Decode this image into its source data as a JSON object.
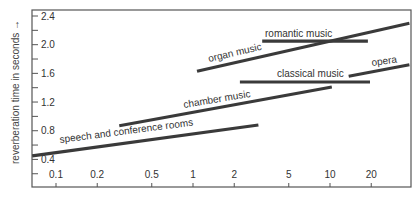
{
  "chart_data": {
    "type": "line",
    "title": "",
    "xlabel": "",
    "ylabel": "reverberation time in seconds →",
    "xscale": "log",
    "x_ticks": [
      0.1,
      0.2,
      0.5,
      1,
      2,
      5,
      10,
      20
    ],
    "x_tick_labels": [
      "0.1",
      "0.2",
      "0.5",
      "1",
      "2",
      "5",
      "10",
      "20"
    ],
    "y_ticks": [
      0.4,
      0.8,
      1.2,
      1.6,
      2.0,
      2.4
    ],
    "y_tick_labels": [
      "0.4",
      "0.8",
      "1.2",
      "1.6",
      "2.0",
      "2.4"
    ],
    "y_minor_ticks": [
      0.2,
      0.6,
      1.0,
      1.4,
      1.8,
      2.2
    ],
    "xlim": [
      0.067,
      38
    ],
    "ylim": [
      0.0,
      2.5
    ],
    "grid": false,
    "legend": "inline labels",
    "series": [
      {
        "name": "speech and conference rooms",
        "x": [
          0.067,
          3.0
        ],
        "y": [
          0.45,
          0.88
        ]
      },
      {
        "name": "chamber music",
        "x": [
          0.29,
          10.3
        ],
        "y": [
          0.87,
          1.41
        ]
      },
      {
        "name": "organ music",
        "x": [
          1.07,
          38
        ],
        "y": [
          1.63,
          2.3
        ]
      },
      {
        "name": "romantic music",
        "x": [
          3.2,
          18.9
        ],
        "y": [
          2.05,
          2.05
        ]
      },
      {
        "name": "classical music",
        "x": [
          2.2,
          19.6
        ],
        "y": [
          1.48,
          1.48
        ]
      },
      {
        "name": "opera",
        "x": [
          13.7,
          38
        ],
        "y": [
          1.56,
          1.72
        ]
      }
    ],
    "labels": [
      {
        "text": "speech and conference rooms",
        "x": 60,
        "y": 143,
        "angle": -7.5
      },
      {
        "text": "chamber music",
        "x": 184,
        "y": 108,
        "angle": -9.5
      },
      {
        "text": "organ music",
        "x": 209,
        "y": 62,
        "angle": -13
      },
      {
        "text": "romantic music",
        "x": 265,
        "y": 37,
        "angle": 0
      },
      {
        "text": "classical music",
        "x": 277,
        "y": 77,
        "angle": 0
      },
      {
        "text": "opera",
        "x": 372,
        "y": 66,
        "angle": -8
      }
    ]
  },
  "layout": {
    "plot": {
      "left": 32,
      "right": 411,
      "top": 10,
      "bottom": 187
    },
    "x_origin_px": 193,
    "px_per_decade": 137,
    "y_ref_value": 2.4,
    "y_ref_px": 16,
    "px_per_unit": 71.7,
    "line_color": "#3a3a3a",
    "axis_color": "#555555"
  }
}
